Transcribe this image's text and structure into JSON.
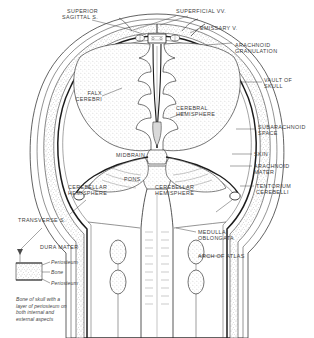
{
  "figure": {
    "type": "anatomical-line-diagram",
    "background": "#ffffff",
    "ink": "#2b2b2b",
    "label_color": "#3d3d3d"
  },
  "labels": {
    "superior_sagittal_sinus": "SUPERIOR\nSAGITTAL S.",
    "superficial_veins": "SUPERFICIAL VV.",
    "emissary_vein": "EMISSARY V.",
    "arachnoid_granulation": "ARACHNOID\nGRANULATION",
    "vault_of_skull": "VAULT OF\nSKULL",
    "falx_cerebri": "FALX\nCEREBRI",
    "cerebral_hemisphere": "CEREBRAL\nHEMISPHERE",
    "subarachnoid_space": "SUBARACHNOID\nSPACE",
    "midbrain": "MIDBRAIN",
    "skin": "SKIN",
    "arachnoid_mater": "ARACHNOID\nMATER",
    "pons": "PONS",
    "tentorium_cerebelli": "TENTORIUM\nCEREBELLI",
    "cerebellar_hemisphere_left": "CEREBELLAR\nHEMISPHERE",
    "cerebellar_hemisphere_right": "CEREBELLAR\nHEMISPHERE",
    "transverse_sinus": "TRANSVERSE S.",
    "dura_mater": "DURA MATER",
    "medulla_oblongata": "MEDULLA\nOBLONGATA",
    "arch_of_atlas": "ARCH OF ATLAS"
  },
  "inset": {
    "periosteum_outer": "Periosteum",
    "bone": "Bone",
    "periosteum_inner": "Periosteum",
    "caption": "Bone of skull with a\nlayer of periosteum on\nboth internal and\nexternal aspects"
  }
}
